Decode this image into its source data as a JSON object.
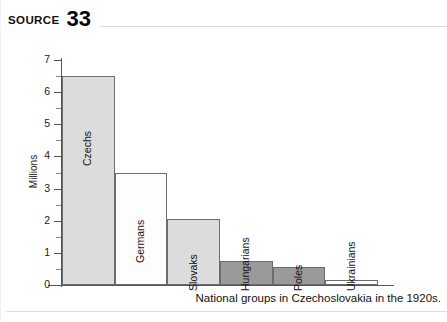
{
  "header": {
    "source_label": "SOURCE",
    "source_number": "33"
  },
  "caption": "National groups in Czechoslovakia in the 1920s.",
  "colors": {
    "light_gray_bar": "#dcdcdc",
    "white_bar": "#fdfdfd",
    "dark_gray_bar": "#9a9a9a",
    "bar_outline": "#6d6d6d",
    "axis": "#555555",
    "rule": "#dcdcdc",
    "text": "#111111"
  },
  "chart_data": {
    "type": "bar",
    "title": "",
    "subtitle": "",
    "xlabel": "",
    "ylabel": "Millions",
    "ylim": [
      0,
      7
    ],
    "ytick_step": 1,
    "yminor_step": 0.5,
    "grid": false,
    "legend": "none",
    "categories": [
      "Czechs",
      "Germans",
      "Slovaks",
      "Hungarians",
      "Poles",
      "Ukrainians"
    ],
    "values": [
      6.5,
      3.5,
      2.05,
      0.75,
      0.55,
      0.15
    ],
    "bar_fills": [
      "#dcdcdc",
      "#fdfdfd",
      "#dcdcdc",
      "#9a9a9a",
      "#9a9a9a",
      "#fdfdfd"
    ],
    "ytick_labels": [
      "0",
      "1",
      "2",
      "3",
      "4",
      "5",
      "6",
      "7"
    ],
    "ytick_values": [
      0,
      1,
      2,
      3,
      4,
      5,
      6,
      7
    ]
  }
}
